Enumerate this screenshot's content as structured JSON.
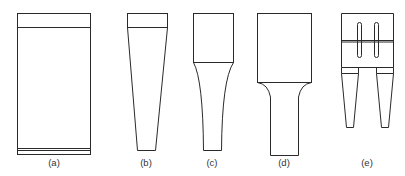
{
  "figure": {
    "stroke_color": "#2a2a2a",
    "background": "#ffffff",
    "panels": [
      {
        "id": "a",
        "label": "(a)",
        "shape": "cylindrical / block horn"
      },
      {
        "id": "b",
        "label": "(b)",
        "shape": "conical (linear taper) horn"
      },
      {
        "id": "c",
        "label": "(c)",
        "shape": "exponential / catenoidal horn"
      },
      {
        "id": "d",
        "label": "(d)",
        "shape": "stepped horn with fillet"
      },
      {
        "id": "e",
        "label": "(e)",
        "shape": "slotted horn with two tapered prongs"
      }
    ]
  }
}
